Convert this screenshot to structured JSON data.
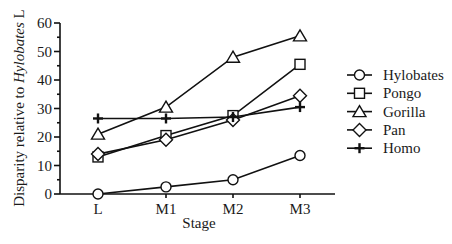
{
  "chart_data": {
    "type": "line",
    "title": "",
    "xlabel": "Stage",
    "ylabel_prefix": "Disparity relative to ",
    "ylabel_italic": "Hylobates",
    "ylabel_suffix": " L",
    "ylabel": "Disparity relative to Hylobates L",
    "ylim": [
      0,
      60
    ],
    "yticks": [
      "0",
      "10",
      "20",
      "30",
      "40",
      "50",
      "60"
    ],
    "categories": [
      "L",
      "M1",
      "M2",
      "M3"
    ],
    "grid": false,
    "legend_position": "right",
    "series": [
      {
        "name": "Hylobates",
        "marker": "circle",
        "values": [
          0,
          2.5,
          5,
          13.5
        ]
      },
      {
        "name": "Pongo",
        "marker": "square",
        "values": [
          13,
          20.5,
          27.5,
          45.5
        ]
      },
      {
        "name": "Gorilla",
        "marker": "triangle",
        "values": [
          21,
          30.5,
          48,
          55.5
        ]
      },
      {
        "name": "Pan",
        "marker": "diamond",
        "values": [
          14,
          19,
          26,
          34.5
        ]
      },
      {
        "name": "Homo",
        "marker": "plus",
        "values": [
          26.5,
          26.5,
          27,
          30.5
        ]
      }
    ]
  },
  "colors": {
    "line": "#111111",
    "background": "#ffffff"
  }
}
